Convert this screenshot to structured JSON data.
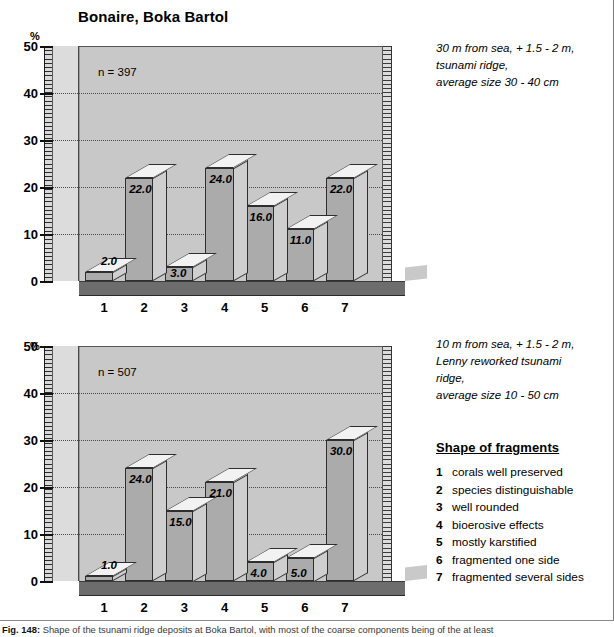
{
  "figure": {
    "caption_prefix": "Fig. 148:",
    "caption_text": "Shape of the tsunami ridge deposits at Boka Bartol, with most of the coarse components being of the at least"
  },
  "charts": [
    {
      "id": "top",
      "title": "Bonaire, Boka Bartol",
      "axis_unit": "%",
      "n_label": "n = 397",
      "yticks": [
        "0",
        "10",
        "20",
        "30",
        "40",
        "50"
      ],
      "categories": [
        "1",
        "2",
        "3",
        "4",
        "5",
        "6",
        "7"
      ],
      "values": [
        2.0,
        22.0,
        3.0,
        24.0,
        16.0,
        11.0,
        22.0
      ],
      "value_labels": [
        "2.0",
        "22.0",
        "3.0",
        "24.0",
        "16.0",
        "11.0",
        "22.0"
      ],
      "notes": [
        "30 m from sea, + 1.5 - 2 m,",
        "tsunami ridge,",
        "average size 30 - 40 cm"
      ]
    },
    {
      "id": "bottom",
      "title": "",
      "axis_unit": "%",
      "n_label": "n = 507",
      "yticks": [
        "0",
        "10",
        "20",
        "30",
        "40",
        "50"
      ],
      "categories": [
        "1",
        "2",
        "3",
        "4",
        "5",
        "6",
        "7"
      ],
      "values": [
        1.0,
        24.0,
        15.0,
        21.0,
        4.0,
        5.0,
        30.0
      ],
      "value_labels": [
        "1.0",
        "24.0",
        "15.0",
        "21.0",
        "4.0",
        "5.0",
        "30.0"
      ],
      "notes": [
        "10 m from sea, + 1.5 - 2 m,",
        "Lenny reworked tsunami",
        "ridge,",
        "average size 10 - 50 cm"
      ]
    }
  ],
  "legend": {
    "heading": "Shape of fragments",
    "items": [
      {
        "num": "1",
        "label": "corals well preserved"
      },
      {
        "num": "2",
        "label": "species distinguishable"
      },
      {
        "num": "3",
        "label": "well rounded"
      },
      {
        "num": "4",
        "label": "bioerosive effects"
      },
      {
        "num": "5",
        "label": "mostly karstified"
      },
      {
        "num": "6",
        "label": "fragmented one side"
      },
      {
        "num": "7",
        "label": "fragmented several sides"
      }
    ]
  },
  "chart_data": [
    {
      "type": "bar",
      "title": "Bonaire, Boka Bartol",
      "subtitle": "30 m from sea, + 1.5 - 2 m, tsunami ridge, average size 30 - 40 cm",
      "xlabel": "Shape of fragments",
      "ylabel": "%",
      "ylim": [
        0,
        50
      ],
      "ytick_step": 10,
      "grid": true,
      "legend_position": "right",
      "annotations": [
        "n = 397"
      ],
      "categories": [
        "1",
        "2",
        "3",
        "4",
        "5",
        "6",
        "7"
      ],
      "category_names": [
        "corals well preserved",
        "species distinguishable",
        "well rounded",
        "bioerosive effects",
        "mostly karstified",
        "fragmented one side",
        "fragmented several sides"
      ],
      "values": [
        2.0,
        22.0,
        3.0,
        24.0,
        16.0,
        11.0,
        22.0
      ]
    },
    {
      "type": "bar",
      "title": "",
      "subtitle": "10 m from sea, + 1.5 - 2 m, Lenny reworked tsunami ridge, average size 10 - 50 cm",
      "xlabel": "Shape of fragments",
      "ylabel": "%",
      "ylim": [
        0,
        50
      ],
      "ytick_step": 10,
      "grid": true,
      "legend_position": "right",
      "annotations": [
        "n = 507"
      ],
      "categories": [
        "1",
        "2",
        "3",
        "4",
        "5",
        "6",
        "7"
      ],
      "category_names": [
        "corals well preserved",
        "species distinguishable",
        "well rounded",
        "bioerosive effects",
        "mostly karstified",
        "fragmented one side",
        "fragmented several sides"
      ],
      "values": [
        1.0,
        24.0,
        15.0,
        21.0,
        4.0,
        5.0,
        30.0
      ]
    }
  ]
}
